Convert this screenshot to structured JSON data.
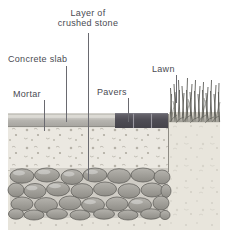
{
  "diagram": {
    "title_visible": false,
    "type": "construction-cross-section",
    "canvas": {
      "width": 228,
      "height": 238
    },
    "labels": [
      {
        "id": "layer-of-crushed-stone",
        "text": "Layer of",
        "text2": "crushed stone",
        "x": 52,
        "y": 8,
        "leader_x": 88,
        "leader_top": 33,
        "leader_bottom": 180
      },
      {
        "id": "concrete-slab",
        "text": "Concrete slab",
        "x": 8,
        "y": 54,
        "leader_x": 66,
        "leader_top": 66,
        "leader_bottom": 122
      },
      {
        "id": "mortar",
        "text": "Mortar",
        "x": 12,
        "y": 89,
        "leader_x": 44,
        "leader_top": 100,
        "leader_bottom": 131
      },
      {
        "id": "pavers",
        "text": "Pavers",
        "x": 96,
        "y": 87,
        "leader_x": 128,
        "leader_top": 98,
        "leader_bottom": 122
      },
      {
        "id": "lawn",
        "text": "Lawn",
        "x": 150,
        "y": 64,
        "leader_x": 176,
        "leader_top": 75,
        "leader_bottom": 103
      }
    ],
    "layers": [
      {
        "id": "soil-subgrade",
        "label_hidden": "soil",
        "color": "#e6e3da",
        "x": 8,
        "y": 118,
        "w": 212,
        "h": 112
      },
      {
        "id": "concrete-slab-band",
        "color": "#b9b7b2",
        "x": 8,
        "y": 117,
        "w": 107,
        "h": 10
      },
      {
        "id": "mortar-band",
        "color": "#d3d1cb",
        "x": 8,
        "y": 115,
        "w": 107,
        "h": 3
      },
      {
        "id": "pavers-band",
        "color": "#55535a",
        "x": 115,
        "y": 114,
        "w": 53,
        "h": 14
      },
      {
        "id": "crushed-stone-fill",
        "color": "#eae7e0",
        "x": 8,
        "y": 128,
        "w": 160,
        "h": 40
      },
      {
        "id": "cobblestone-base",
        "color": "#9d9b95",
        "x": 10,
        "y": 168,
        "w": 158,
        "h": 50
      },
      {
        "id": "lawn-topsoil",
        "color": "#e3e0d7",
        "x": 168,
        "y": 122,
        "w": 52,
        "h": 108
      },
      {
        "id": "grass-blades",
        "color": "#4a4a4a",
        "x": 168,
        "y": 76,
        "w": 52,
        "h": 46
      }
    ],
    "colors": {
      "label_text": "#4a4a52",
      "leader_line": "#6a6a70",
      "paver_dark": "#55535a",
      "slab_gray": "#b9b7b2",
      "soil_tan": "#e6e3da",
      "cobble_gray": "#9d9b95",
      "grass_dark": "#43433f",
      "background": "#ffffff"
    }
  }
}
